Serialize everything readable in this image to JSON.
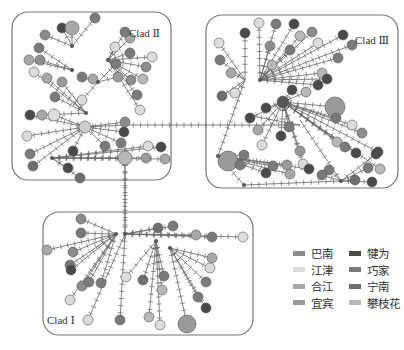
{
  "clades": [
    {
      "id": "II",
      "label": "Clad Ⅱ"
    },
    {
      "id": "III",
      "label": "Clad Ⅲ"
    },
    {
      "id": "I",
      "label": "Clad Ⅰ"
    }
  ],
  "legend": {
    "items": [
      {
        "label": "巴南",
        "color": "#8c8c8c"
      },
      {
        "label": "犍为",
        "color": "#4a4a4a"
      },
      {
        "label": "江津",
        "color": "#dcdcdc"
      },
      {
        "label": "巧家",
        "color": "#7a7a7a"
      },
      {
        "label": "合江",
        "color": "#a8a8a8"
      },
      {
        "label": "宁南",
        "color": "#6e6e6e"
      },
      {
        "label": "宜宾",
        "color": "#9a9a9a"
      },
      {
        "label": "攀枝花",
        "color": "#b8b8b8"
      }
    ]
  }
}
